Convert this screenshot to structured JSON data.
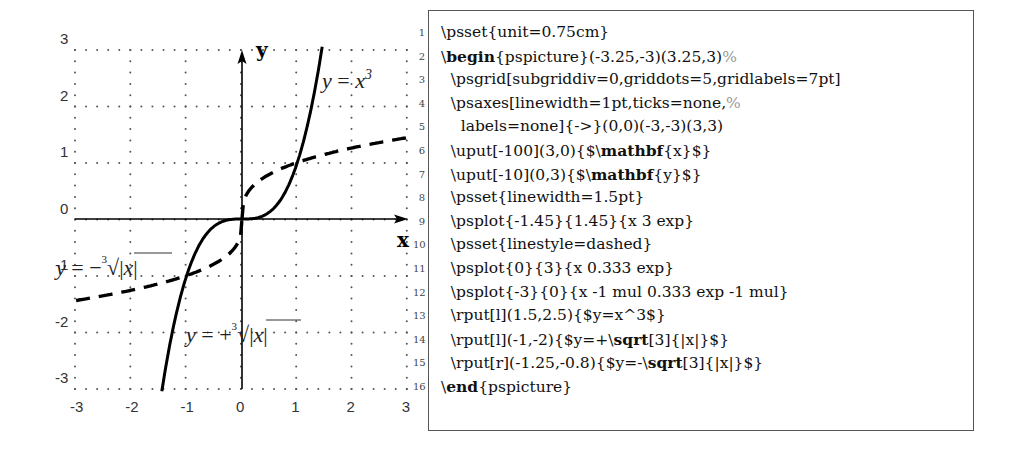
{
  "figure": {
    "grid_labels_x": [
      "-3",
      "-2",
      "-1",
      "0",
      "1",
      "2",
      "3"
    ],
    "grid_labels_y": [
      "3",
      "2",
      "1",
      "0",
      "-1",
      "-2",
      "-3"
    ],
    "axis_label_x": "x",
    "axis_label_y": "y",
    "label_cubic": "y = x³",
    "label_cbrt_pos": "y = +∛|x|",
    "label_cbrt_neg": "y = −∛|x|"
  },
  "chart_data": {
    "type": "line",
    "title": "",
    "xlabel": "x",
    "ylabel": "y",
    "xlim": [
      -3.25,
      3.25
    ],
    "ylim": [
      -3,
      3
    ],
    "grid": true,
    "x_ticks": [
      -3,
      -2,
      -1,
      0,
      1,
      2,
      3
    ],
    "y_ticks": [
      -3,
      -2,
      -1,
      0,
      1,
      2,
      3
    ],
    "series": [
      {
        "name": "y = x^3",
        "style": "solid",
        "x": [
          -1.45,
          -1.2,
          -1.0,
          -0.6,
          -0.3,
          0,
          0.3,
          0.6,
          1.0,
          1.2,
          1.45
        ],
        "values": [
          -3.05,
          -1.73,
          -1.0,
          -0.22,
          -0.03,
          0,
          0.03,
          0.22,
          1.0,
          1.73,
          3.05
        ]
      },
      {
        "name": "y = +cbrt(|x|)",
        "style": "dashed",
        "x": [
          0,
          0.5,
          1,
          1.5,
          2,
          2.5,
          3
        ],
        "values": [
          0,
          0.79,
          1.0,
          1.14,
          1.26,
          1.36,
          1.44
        ]
      },
      {
        "name": "y = -cbrt(|x|)",
        "style": "dashed",
        "x": [
          -3,
          -2.5,
          -2,
          -1.5,
          -1,
          -0.5,
          0
        ],
        "values": [
          -1.44,
          -1.36,
          -1.26,
          -1.14,
          -1.0,
          -0.79,
          0
        ]
      }
    ],
    "annotations": [
      {
        "text": "y = x^3",
        "x": 1.5,
        "y": 2.5
      },
      {
        "text": "y = +cbrt(|x|)",
        "x": -1,
        "y": -2
      },
      {
        "text": "y = -cbrt(|x|)",
        "x": -1.25,
        "y": -0.8
      }
    ]
  },
  "code": {
    "lines": [
      {
        "no": "1",
        "parts": [
          {
            "t": "\\psset{unit=0.75cm}"
          }
        ]
      },
      {
        "no": "2",
        "parts": [
          {
            "t": "\\"
          },
          {
            "t": "begin",
            "kw": true
          },
          {
            "t": "{pspicture}(-3.25,-3)(3.25,3)"
          },
          {
            "t": "%",
            "cm": true
          }
        ]
      },
      {
        "no": "3",
        "parts": [
          {
            "t": "  \\psgrid[subgriddiv=0,griddots=5,gridlabels=7pt]"
          }
        ]
      },
      {
        "no": "4",
        "parts": [
          {
            "t": "  \\psaxes[linewidth=1pt,ticks=none,"
          },
          {
            "t": "%",
            "cm": true
          }
        ]
      },
      {
        "no": "5",
        "parts": [
          {
            "t": "    labels=none]{->}(0,0)(-3,-3)(3,3)"
          }
        ]
      },
      {
        "no": "6",
        "parts": [
          {
            "t": "  \\uput[-100](3,0){$\\"
          },
          {
            "t": "mathbf",
            "kw": true
          },
          {
            "t": "{x}$}"
          }
        ]
      },
      {
        "no": "7",
        "parts": [
          {
            "t": "  \\uput[-10](0,3){$\\"
          },
          {
            "t": "mathbf",
            "kw": true
          },
          {
            "t": "{y}$}"
          }
        ]
      },
      {
        "no": "8",
        "parts": [
          {
            "t": "  \\psset{linewidth=1.5pt}"
          }
        ]
      },
      {
        "no": "9",
        "parts": [
          {
            "t": "  \\psplot{-1.45}{1.45}{x 3 exp}"
          }
        ]
      },
      {
        "no": "10",
        "parts": [
          {
            "t": "  \\psset{linestyle=dashed}"
          }
        ]
      },
      {
        "no": "11",
        "parts": [
          {
            "t": "  \\psplot{0}{3}{x 0.333 exp}"
          }
        ]
      },
      {
        "no": "12",
        "parts": [
          {
            "t": "  \\psplot{-3}{0}{x -1 mul 0.333 exp -1 mul}"
          }
        ]
      },
      {
        "no": "13",
        "parts": [
          {
            "t": "  \\rput[l](1.5,2.5){$y=x^3$}"
          }
        ]
      },
      {
        "no": "14",
        "parts": [
          {
            "t": "  \\rput[l](-1,-2){$y=+\\"
          },
          {
            "t": "sqrt",
            "kw": true
          },
          {
            "t": "[3]{|x|}$}"
          }
        ]
      },
      {
        "no": "15",
        "parts": [
          {
            "t": "  \\rput[r](-1.25,-0.8){$y=-\\"
          },
          {
            "t": "sqrt",
            "kw": true
          },
          {
            "t": "[3]{|x|}$}"
          }
        ]
      },
      {
        "no": "16",
        "parts": [
          {
            "t": "\\"
          },
          {
            "t": "end",
            "kw": true
          },
          {
            "t": "{pspicture}"
          }
        ]
      }
    ]
  }
}
